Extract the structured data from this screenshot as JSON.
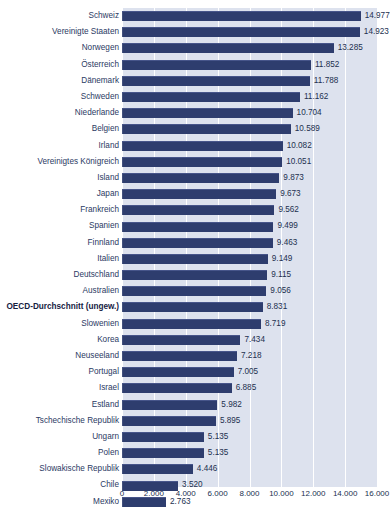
{
  "chart_data": {
    "type": "bar",
    "orientation": "horizontal",
    "title": "",
    "xlabel": "",
    "ylabel": "",
    "xlim": [
      0,
      16000
    ],
    "xticks": [
      "0",
      "2.000",
      "4.000",
      "6.000",
      "8.000",
      "10.000",
      "12.000",
      "14.000",
      "16.000"
    ],
    "xtick_values": [
      0,
      2000,
      4000,
      6000,
      8000,
      10000,
      12000,
      14000,
      16000
    ],
    "grid": true,
    "legend": "none",
    "bar_color": "#2e3d6e",
    "plot_background": "#dde2ee",
    "gridline_color": "#ffffff",
    "label_color": "#2b3a63",
    "highlight_category": "OECD-Durchschnitt (ungew.)",
    "categories": [
      "Schweiz",
      "Vereinigte Staaten",
      "Norwegen",
      "Österreich",
      "Dänemark",
      "Schweden",
      "Niederlande",
      "Belgien",
      "Irland",
      "Vereinigtes Königreich",
      "Island",
      "Japan",
      "Frankreich",
      "Spanien",
      "Finnland",
      "Italien",
      "Deutschland",
      "Australien",
      "OECD-Durchschnitt (ungew.)",
      "Slowenien",
      "Korea",
      "Neuseeland",
      "Portugal",
      "Israel",
      "Estland",
      "Tschechische Republik",
      "Ungarn",
      "Polen",
      "Slowakische Republik",
      "Chile",
      "Mexiko"
    ],
    "values": [
      14977,
      14923,
      13285,
      11852,
      11788,
      11162,
      10704,
      10589,
      10082,
      10051,
      9873,
      9673,
      9562,
      9499,
      9463,
      9149,
      9115,
      9056,
      8831,
      8719,
      7434,
      7218,
      7005,
      6885,
      5982,
      5895,
      5135,
      5135,
      4446,
      3520,
      2763
    ],
    "value_labels": [
      "14.977",
      "14.923",
      "13.285",
      "11.852",
      "11.788",
      "11.162",
      "10.704",
      "10.589",
      "10.082",
      "10.051",
      "9.873",
      "9.673",
      "9.562",
      "9.499",
      "9.463",
      "9.149",
      "9.115",
      "9.056",
      "8.831",
      "8.719",
      "7.434",
      "7.218",
      "7.005",
      "6.885",
      "5.982",
      "5.895",
      "5.135",
      "5.135",
      "4.446",
      "3.520",
      "2.763"
    ]
  }
}
